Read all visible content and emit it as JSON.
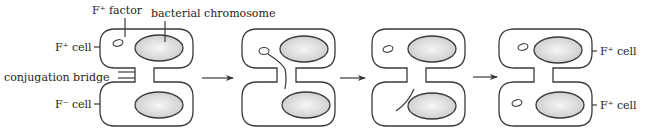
{
  "diagram": {
    "labels": {
      "f_factor": "F⁺ factor",
      "bacterial_chromosome": "bacterial chromosome",
      "donor_cell_left": "F⁺ cell",
      "conjugation_bridge": "conjugation bridge",
      "recipient_cell_left": "F⁻ cell",
      "result_top_right": "F⁺ cell",
      "result_bottom_right": "F⁺ cell"
    },
    "stages": [
      {
        "id": 1,
        "description": "F⁺ and F⁻ cells joined by conjugation bridge; F factor in donor"
      },
      {
        "id": 2,
        "description": "F factor strand passes through bridge"
      },
      {
        "id": 3,
        "description": "Single strand transferred into recipient"
      },
      {
        "id": 4,
        "description": "Both cells now carry F factor (F⁺)"
      }
    ],
    "arrows": 3,
    "colors": {
      "outline": "#3a3a3a",
      "chromosome_fill_center": "#f4f4f4",
      "chromosome_fill_edge": "#cfcfcf",
      "text": "#231f20"
    }
  }
}
